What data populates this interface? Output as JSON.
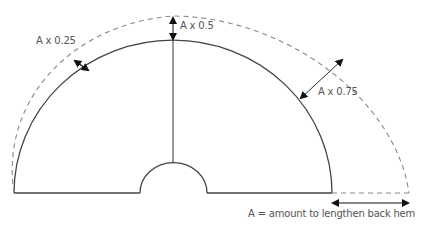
{
  "diagram": {
    "labels": {
      "quarter": "A x 0.25",
      "half": "A x 0.5",
      "three_quarter": "A x 0.75",
      "legend": "A = amount to lengthen back hem"
    },
    "offset_factors": [
      0,
      0.25,
      0.5,
      0.75,
      1
    ],
    "colors": {
      "line": "#444444",
      "dashed": "#888888",
      "arrow": "#111111",
      "text": "#555555"
    }
  }
}
